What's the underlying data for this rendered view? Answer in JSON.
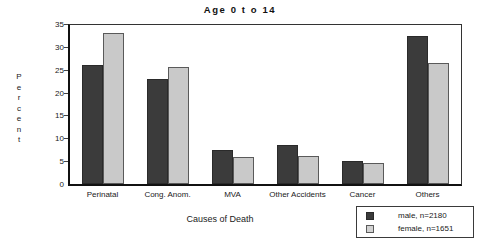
{
  "chart_data": {
    "type": "bar",
    "title": "Age  0  t o  14",
    "xlabel": "Causes of Death",
    "ylabel": "Percent",
    "ylim": [
      0,
      35
    ],
    "yticks": [
      0,
      5,
      10,
      15,
      20,
      25,
      30,
      35
    ],
    "grid": false,
    "legend_position": "bottom-right",
    "categories": [
      "Perinatal",
      "Cong. Anom.",
      "MVA",
      "Other Accidents",
      "Cancer",
      "Others"
    ],
    "series": [
      {
        "name": "male, n=2180",
        "color": "#3b3b3b",
        "values": [
          26.1,
          22.9,
          7.5,
          8.6,
          5.1,
          32.3
        ]
      },
      {
        "name": "female, n=1651",
        "color": "#c9c9c9",
        "values": [
          33.0,
          25.5,
          6.0,
          6.2,
          4.6,
          26.5
        ]
      }
    ]
  },
  "ylabel_letters": [
    "P",
    "e",
    "r",
    "c",
    "e",
    "n",
    "t"
  ],
  "legend": {
    "rows": [
      {
        "label": "male, n=2180",
        "swatch": "male-swatch"
      },
      {
        "label": "female, n=1651",
        "swatch": "female-swatch"
      }
    ]
  },
  "colors": {
    "male_bar": "#3b3b3b",
    "female_bar": "#c9c9c9",
    "axis": "#111111",
    "background": "#ffffff"
  }
}
